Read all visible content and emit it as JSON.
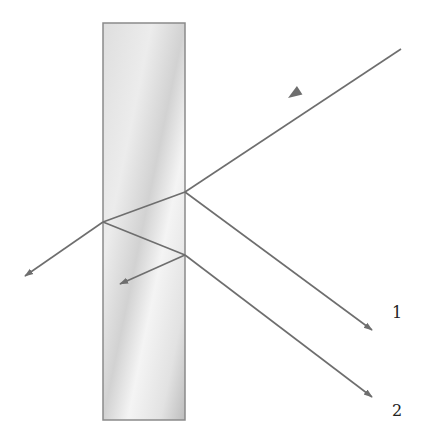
{
  "colors": {
    "ray": "#6e6e6e",
    "slab_edge": "#8a8a8a",
    "slab_fill_light": "#f2f2f2",
    "slab_fill_dark": "#c8c8c8",
    "label": "#222222"
  },
  "slab": {
    "x": 103,
    "y": 23,
    "width": 82,
    "height": 397
  },
  "rays": [
    {
      "id": "incident",
      "x1": 401,
      "y1": 49,
      "x2": 185,
      "y2": 192,
      "arrow": {
        "x": 288,
        "y": 98,
        "dir": "down-left"
      }
    },
    {
      "id": "reflected-1",
      "x1": 185,
      "y1": 192,
      "x2": 372,
      "y2": 330,
      "arrow": {
        "x": 372,
        "y": 330,
        "dir": "down-right"
      }
    },
    {
      "id": "refracted-inside",
      "x1": 185,
      "y1": 192,
      "x2": 103,
      "y2": 222
    },
    {
      "id": "transmitted-left",
      "x1": 103,
      "y1": 222,
      "x2": 25,
      "y2": 276,
      "arrow": {
        "x": 25,
        "y": 276,
        "dir": "down-left"
      }
    },
    {
      "id": "internal-reflection",
      "x1": 103,
      "y1": 222,
      "x2": 185,
      "y2": 255
    },
    {
      "id": "ray-2",
      "x1": 185,
      "y1": 255,
      "x2": 372,
      "y2": 397,
      "arrow": {
        "x": 372,
        "y": 397,
        "dir": "down-right"
      }
    },
    {
      "id": "internal-reflection-2",
      "x1": 185,
      "y1": 255,
      "x2": 120,
      "y2": 284,
      "arrow": {
        "x": 120,
        "y": 284,
        "dir": "down-left"
      }
    }
  ],
  "labels": [
    {
      "id": "label-1",
      "text": "1",
      "x": 392,
      "y": 318
    },
    {
      "id": "label-2",
      "text": "2",
      "x": 392,
      "y": 416
    }
  ]
}
